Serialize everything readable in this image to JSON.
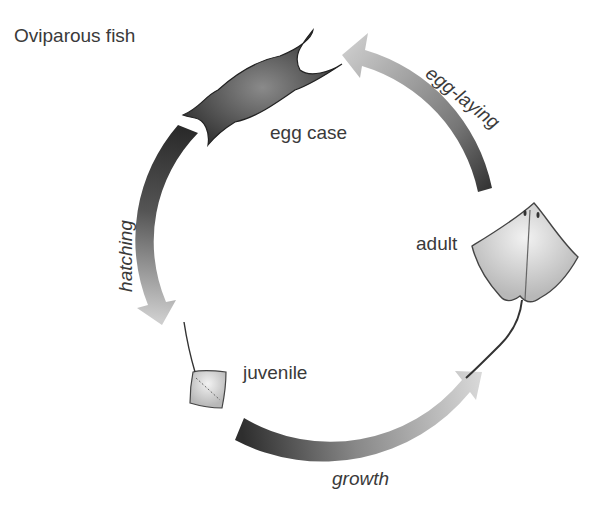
{
  "title": "Oviparous fish",
  "stages": {
    "egg_case": "egg case",
    "adult": "adult",
    "juvenile": "juvenile"
  },
  "transitions": {
    "egg_laying": "egg-laying",
    "hatching": "hatching",
    "growth": "growth"
  },
  "colors": {
    "arrow_dark": "#2e2e2e",
    "arrow_light": "#c8c8c8",
    "text": "#3a3a3a"
  }
}
